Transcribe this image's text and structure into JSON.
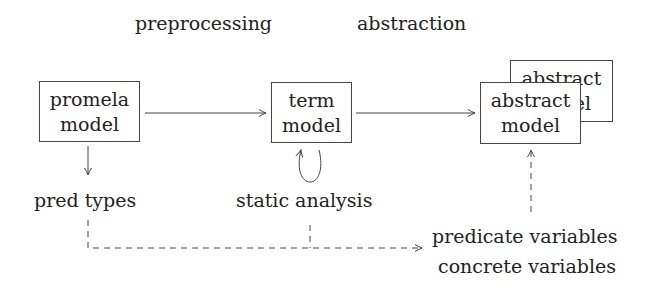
{
  "stages": {
    "preprocessing": "preprocessing",
    "abstraction": "abstraction"
  },
  "nodes": {
    "promela": {
      "line1": "promela",
      "line2": "model"
    },
    "term": {
      "line1": "term",
      "line2": "model"
    },
    "abstract_back": {
      "line1": "abstract",
      "line2": "model"
    },
    "abstract_front": {
      "line1": "abstract",
      "line2": "model"
    }
  },
  "labels": {
    "pred_types": "pred types",
    "static_analysis": "static analysis",
    "predicate_variables": "predicate variables",
    "concrete_variables": "concrete variables"
  },
  "colors": {
    "stroke": "#444444",
    "text": "#222222",
    "background": "#ffffff"
  }
}
